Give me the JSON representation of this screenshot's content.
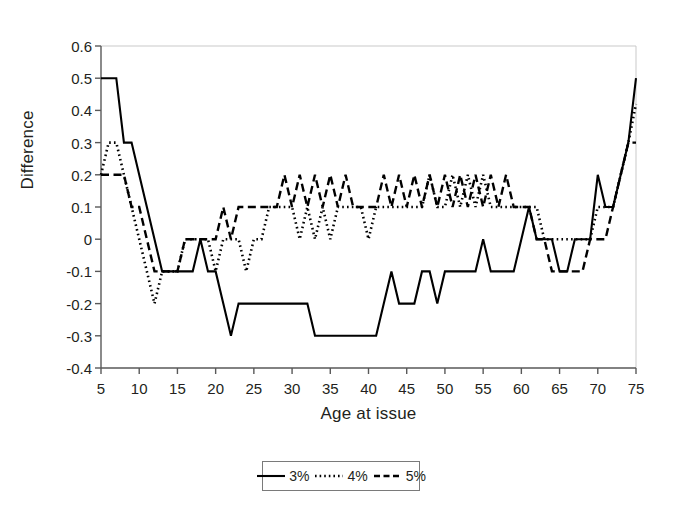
{
  "chart_data": {
    "type": "line",
    "title": "",
    "xlabel": "Age at issue",
    "ylabel": "Difference",
    "xlim": [
      5,
      75
    ],
    "ylim": [
      -0.4,
      0.6
    ],
    "xticks": [
      5,
      10,
      15,
      20,
      25,
      30,
      35,
      40,
      45,
      50,
      55,
      60,
      65,
      70,
      75
    ],
    "yticks": [
      -0.4,
      -0.3,
      -0.2,
      -0.1,
      0,
      0.1,
      0.2,
      0.3,
      0.4,
      0.5,
      0.6
    ],
    "ytick_labels": [
      "-0.4",
      "-0.3",
      "-0.2",
      "-0.1",
      "0",
      "0.1",
      "0.2",
      "0.3",
      "0.4",
      "0.5",
      "0.6"
    ],
    "xtick_labels": [
      "5",
      "10",
      "15",
      "20",
      "25",
      "30",
      "35",
      "40",
      "45",
      "50",
      "55",
      "60",
      "65",
      "70",
      "75"
    ],
    "grid": false,
    "legend_position": "below-center",
    "x": [
      5,
      6,
      7,
      8,
      9,
      10,
      11,
      12,
      13,
      14,
      15,
      16,
      17,
      18,
      19,
      20,
      21,
      22,
      23,
      24,
      25,
      26,
      27,
      28,
      29,
      30,
      31,
      32,
      33,
      34,
      35,
      36,
      37,
      38,
      39,
      40,
      41,
      42,
      43,
      44,
      45,
      46,
      47,
      48,
      49,
      50,
      51,
      52,
      53,
      54,
      55,
      56,
      57,
      58,
      59,
      60,
      61,
      62,
      63,
      64,
      65,
      66,
      67,
      68,
      69,
      70,
      71,
      72,
      73,
      74,
      75
    ],
    "series": [
      {
        "name": "3%",
        "style": "solid",
        "color": "#000000",
        "values": [
          0.5,
          0.5,
          0.5,
          0.3,
          0.3,
          0.2,
          0.1,
          0.0,
          -0.1,
          -0.1,
          -0.1,
          -0.1,
          -0.1,
          0.0,
          -0.1,
          -0.1,
          -0.2,
          -0.3,
          -0.2,
          -0.2,
          -0.2,
          -0.2,
          -0.2,
          -0.2,
          -0.2,
          -0.2,
          -0.2,
          -0.2,
          -0.3,
          -0.3,
          -0.3,
          -0.3,
          -0.3,
          -0.3,
          -0.3,
          -0.3,
          -0.3,
          -0.2,
          -0.1,
          -0.2,
          -0.2,
          -0.2,
          -0.1,
          -0.1,
          -0.2,
          -0.1,
          -0.1,
          -0.1,
          -0.1,
          -0.1,
          0.0,
          -0.1,
          -0.1,
          -0.1,
          -0.1,
          0.0,
          0.1,
          0.0,
          0.0,
          0.0,
          -0.1,
          -0.1,
          0.0,
          0.0,
          0.0,
          0.2,
          0.1,
          0.1,
          0.2,
          0.3,
          0.5
        ]
      },
      {
        "name": "4%",
        "style": "dotted",
        "color": "#000000",
        "values": [
          0.2,
          0.3,
          0.3,
          0.2,
          0.1,
          0.0,
          -0.1,
          -0.2,
          -0.1,
          -0.1,
          -0.1,
          0.0,
          0.0,
          0.0,
          0.0,
          -0.1,
          0.0,
          0.0,
          0.0,
          -0.1,
          0.0,
          0.0,
          0.1,
          0.1,
          0.1,
          0.1,
          0.0,
          0.1,
          0.0,
          0.1,
          0.0,
          0.1,
          0.1,
          0.1,
          0.1,
          0.0,
          0.1,
          0.1,
          0.1,
          0.1,
          0.1,
          0.1,
          0.1,
          0.2,
          0.1,
          0.1,
          0.2,
          0.1,
          0.2,
          0.1,
          0.2,
          0.1,
          0.1,
          0.1,
          0.1,
          0.1,
          0.1,
          0.1,
          0.0,
          0.0,
          0.0,
          0.0,
          0.0,
          0.0,
          0.0,
          0.1,
          0.1,
          0.1,
          0.2,
          0.3,
          0.42
        ]
      },
      {
        "name": "5%",
        "style": "dashed",
        "color": "#000000",
        "values": [
          0.2,
          0.2,
          0.2,
          0.2,
          0.1,
          0.1,
          0.0,
          -0.1,
          -0.1,
          -0.1,
          -0.1,
          0.0,
          0.0,
          0.0,
          0.0,
          0.0,
          0.1,
          0.0,
          0.1,
          0.1,
          0.1,
          0.1,
          0.1,
          0.1,
          0.2,
          0.1,
          0.2,
          0.1,
          0.2,
          0.1,
          0.2,
          0.1,
          0.2,
          0.1,
          0.1,
          0.1,
          0.1,
          0.2,
          0.1,
          0.2,
          0.1,
          0.2,
          0.1,
          0.2,
          0.1,
          0.2,
          0.1,
          0.2,
          0.1,
          0.2,
          0.1,
          0.2,
          0.1,
          0.2,
          0.1,
          0.1,
          0.1,
          0.0,
          0.0,
          -0.1,
          -0.1,
          -0.1,
          -0.1,
          -0.1,
          0.0,
          0.0,
          0.0,
          0.1,
          0.2,
          0.3,
          0.3
        ]
      }
    ]
  },
  "legend": {
    "items": [
      {
        "label": "3%",
        "style": "solid"
      },
      {
        "label": "4%",
        "style": "dotted"
      },
      {
        "label": "5%",
        "style": "dashed"
      }
    ]
  }
}
